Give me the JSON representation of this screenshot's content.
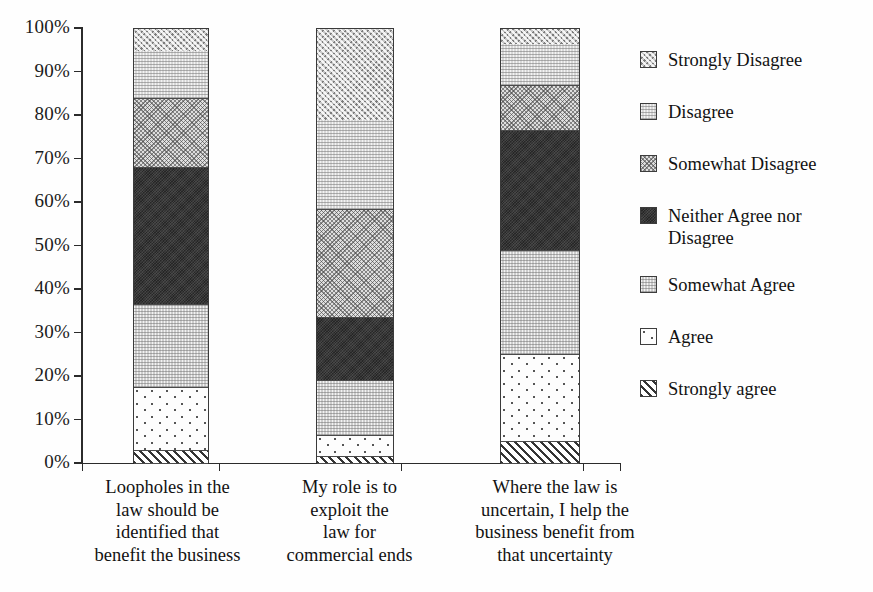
{
  "chart_data": {
    "type": "bar",
    "subtype": "100% stacked bar",
    "title": "",
    "xlabel": "",
    "ylabel": "",
    "ylim": [
      0,
      100
    ],
    "ytick_labels": [
      "100%",
      "90%",
      "80%",
      "70%",
      "60%",
      "50%",
      "40%",
      "30%",
      "20%",
      "10%",
      "0%"
    ],
    "ytick_values": [
      100,
      90,
      80,
      70,
      60,
      50,
      40,
      30,
      20,
      10,
      0
    ],
    "grid": false,
    "legend_position": "right",
    "categories": [
      "Loopholes in the law should be identified that benefit the business",
      "My role is to exploit the law for commercial ends",
      "Where the law is uncertain, I help the business benefit from that uncertainty"
    ],
    "category_lines": [
      [
        "Loopholes in the",
        "law should be",
        "identified that",
        "benefit the business"
      ],
      [
        "My role is to",
        "exploit the",
        "law for",
        "commercial ends"
      ],
      [
        "Where the law is",
        "uncertain, I help the",
        "business benefit from",
        "that uncertainty"
      ]
    ],
    "series": [
      {
        "name": "Strongly Disagree",
        "pattern": "p-strongly-disagree",
        "values": [
          5.0,
          21.0,
          3.5
        ]
      },
      {
        "name": "Disagree",
        "pattern": "p-disagree",
        "values": [
          11.0,
          20.5,
          9.5
        ]
      },
      {
        "name": "Somewhat Disagree",
        "pattern": "p-somewhat-disagree",
        "values": [
          16.0,
          25.0,
          10.5
        ]
      },
      {
        "name": "Neither Agree nor Disagree",
        "pattern": "p-neither",
        "values": [
          31.5,
          14.5,
          27.5
        ]
      },
      {
        "name": "Somewhat Agree",
        "pattern": "p-somewhat-agree",
        "values": [
          19.0,
          12.5,
          24.0
        ]
      },
      {
        "name": "Agree",
        "pattern": "p-agree",
        "values": [
          14.5,
          5.0,
          20.0
        ]
      },
      {
        "name": "Strongly agree",
        "pattern": "p-strongly-agree",
        "values": [
          3.0,
          1.5,
          5.0
        ]
      }
    ],
    "legend_entries": [
      {
        "label": "Strongly Disagree",
        "pattern": "p-strongly-disagree"
      },
      {
        "label": "Disagree",
        "pattern": "p-disagree"
      },
      {
        "label": "Somewhat Disagree",
        "pattern": "p-somewhat-disagree"
      },
      {
        "label": "Neither Agree nor Disagree",
        "pattern": "p-neither"
      },
      {
        "label": "Somewhat Agree",
        "pattern": "p-somewhat-agree"
      },
      {
        "label": "Agree",
        "pattern": "p-agree"
      },
      {
        "label": "Strongly agree",
        "pattern": "p-strongly-agree"
      }
    ]
  }
}
